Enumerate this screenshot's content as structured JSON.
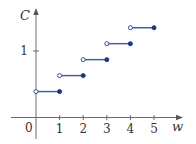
{
  "chart_data": {
    "type": "line",
    "subtype": "step",
    "title": "",
    "xlabel": "w",
    "ylabel": "C",
    "xlim": [
      -1,
      6.2
    ],
    "ylim": [
      -0.3,
      1.65
    ],
    "x_ticks": [
      1,
      2,
      3,
      4,
      5
    ],
    "x_tick_labels": [
      "1",
      "2",
      "3",
      "4",
      "5"
    ],
    "y_ticks": [
      1
    ],
    "y_tick_labels": [
      "1"
    ],
    "origin_label": "0",
    "grid": false,
    "legend": null,
    "series": [
      {
        "name": "C(w)",
        "color": "#4a5ca8",
        "segments": [
          {
            "x_start": 0,
            "x_end": 1,
            "y": 0.39,
            "left_open": true,
            "right_closed": true
          },
          {
            "x_start": 1,
            "x_end": 2,
            "y": 0.63,
            "left_open": true,
            "right_closed": true
          },
          {
            "x_start": 2,
            "x_end": 3,
            "y": 0.87,
            "left_open": true,
            "right_closed": true
          },
          {
            "x_start": 3,
            "x_end": 4,
            "y": 1.11,
            "left_open": true,
            "right_closed": true
          },
          {
            "x_start": 4,
            "x_end": 5,
            "y": 1.35,
            "left_open": true,
            "right_closed": true
          }
        ]
      }
    ]
  },
  "colors": {
    "axis": "#6b6b6b",
    "line": "#4a5ca8",
    "dot_filled": "#1e3484",
    "dot_open_stroke": "#3a4e9a"
  }
}
